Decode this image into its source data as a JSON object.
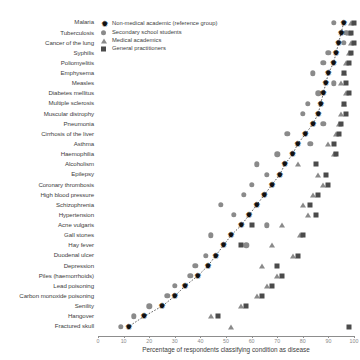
{
  "chart_data": {
    "type": "scatter",
    "title": "",
    "xlabel": "Percentage of respondents classifying condition as disease",
    "ylabel": "",
    "xlim": [
      0,
      100
    ],
    "xticks": [
      0,
      10,
      20,
      30,
      40,
      50,
      60,
      70,
      80,
      90,
      100
    ],
    "xticklabels": [
      "0",
      "10",
      "20",
      "30",
      "40",
      "50",
      "60",
      "70",
      "80",
      "90",
      "100"
    ],
    "grid": false,
    "legend_position": "top-left",
    "categories": [
      "Malaria",
      "Tuberculosis",
      "Cancer of the lung",
      "Syphilis",
      "Poliomyelitis",
      "Emphysema",
      "Measles",
      "Diabetes mellitus",
      "Multiple sclerosis",
      "Muscular distrophy",
      "Pneumonia",
      "Cirrhosis of the liver",
      "Asthma",
      "Haemophilia",
      "Alcoholism",
      "Epilepsy",
      "Coronary thrombosis",
      "High blood pressure",
      "Schizophrenia",
      "Hypertension",
      "Acne vulgaris",
      "Gall stones",
      "Hay fever",
      "Duodenal ulcer",
      "Depression",
      "Piles (haemorrhoids)",
      "Lead poisoning",
      "Carbon monoxide poisoning",
      "Senility",
      "Hangover",
      "Fractured skull"
    ],
    "series": [
      {
        "name": "Non-medical academic (reference group)",
        "marker": "star",
        "color": "#111111",
        "values": [
          96,
          95,
          94,
          93,
          92,
          90,
          89,
          88,
          87,
          86,
          84,
          81,
          78,
          76,
          73,
          71,
          68,
          65,
          62,
          59,
          56,
          52,
          49,
          46,
          43,
          39,
          34,
          30,
          25,
          18,
          12
        ]
      },
      {
        "name": "Secondary school students",
        "marker": "circle",
        "color": "#8a8a8a",
        "values": [
          92,
          97,
          96,
          90,
          88,
          84,
          92,
          86,
          82,
          80,
          88,
          74,
          83,
          70,
          62,
          66,
          60,
          57,
          48,
          53,
          66,
          44,
          58,
          42,
          38,
          36,
          30,
          27,
          20,
          14,
          9
        ]
      },
      {
        "name": "Medical academics",
        "marker": "triangle",
        "color": "#8a8a8a",
        "values": [
          99,
          98,
          99,
          98,
          97,
          96,
          95,
          97,
          96,
          95,
          94,
          93,
          90,
          92,
          78,
          86,
          88,
          84,
          80,
          82,
          72,
          79,
          68,
          76,
          64,
          70,
          66,
          62,
          56,
          44,
          52
        ]
      },
      {
        "name": "General practitioners",
        "marker": "square",
        "color": "#4b4b4b",
        "values": [
          100,
          99,
          100,
          99,
          98,
          96,
          97,
          98,
          96,
          97,
          95,
          94,
          92,
          93,
          85,
          89,
          90,
          86,
          83,
          85,
          60,
          80,
          56,
          78,
          70,
          72,
          68,
          64,
          58,
          47,
          98
        ]
      }
    ],
    "reference_line": {
      "name": "reference trend",
      "style": "dotted",
      "color": "#3a3a3a"
    }
  },
  "legend": {
    "items": [
      {
        "label": "Non-medical academic (reference group)",
        "marker": "star-marker"
      },
      {
        "label": "Secondary school students",
        "marker": "circle-marker"
      },
      {
        "label": "Medical academics",
        "marker": "triangle-marker"
      },
      {
        "label": "General practitioners",
        "marker": "square-marker"
      }
    ]
  }
}
